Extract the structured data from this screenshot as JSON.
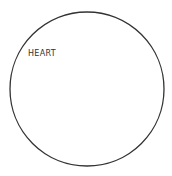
{
  "diagram": {
    "shape": "circle",
    "circle": {
      "cx": 87,
      "cy": 89,
      "r": 77,
      "stroke": "#333333",
      "stroke_width": 1.3,
      "fill": "#ffffff"
    },
    "label": "HEART"
  }
}
